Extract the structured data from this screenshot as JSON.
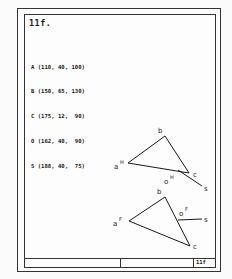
{
  "page": {
    "title": "11f.",
    "footer_code": "11f"
  },
  "points": [
    {
      "name": "A",
      "text": "A (110, 40, 100)"
    },
    {
      "name": "B",
      "text": "B (150, 65, 130)"
    },
    {
      "name": "C",
      "text": "C (175, 12,  90)"
    },
    {
      "name": "O",
      "text": "O (162, 40,  90)"
    },
    {
      "name": "S",
      "text": "S (188, 40,  75)"
    }
  ],
  "views": {
    "front": {
      "labels": {
        "a": "a",
        "a_sup": "H",
        "b": "b",
        "c": "c",
        "o": "o",
        "o_sup": "H",
        "s": "s"
      }
    },
    "top": {
      "labels": {
        "a": "a",
        "a_sup": "F",
        "b": "b",
        "c": "c",
        "o": "o",
        "o_sup": "F",
        "s": "s"
      }
    }
  }
}
